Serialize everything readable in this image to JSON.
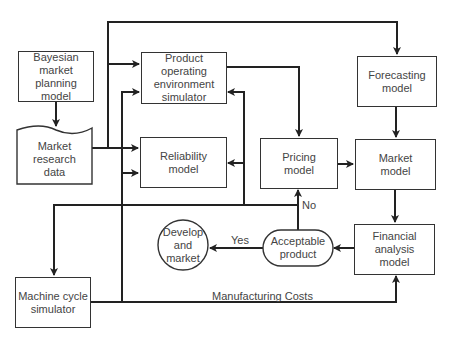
{
  "nodes": {
    "bayesian": "Bayesian\nmarket planning\nmodel",
    "market_research": "Market\nresearch\ndata",
    "product_sim": "Product operating\nenvironment\nsimulator",
    "reliability": "Reliability\nmodel",
    "forecasting": "Forecasting\nmodel",
    "pricing": "Pricing\nmodel",
    "market_model": "Market\nmodel",
    "financial": "Financial\nanalysis\nmodel",
    "acceptable": "Acceptable\nproduct",
    "develop": "Develop\nand\nmarket",
    "machine_cycle": "Machine cycle\nsimulator"
  },
  "labels": {
    "no": "No",
    "yes": "Yes",
    "manufacturing_costs": "Manufacturing Costs"
  },
  "colors": {
    "line": "#222222",
    "text": "#444444"
  }
}
